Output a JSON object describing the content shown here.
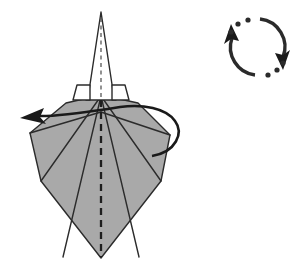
{
  "diagram": {
    "background_color": "#ffffff",
    "paper_fill_color": "#a9a9a9",
    "paper_back_color": "#ffffff",
    "line_color": "#2b2b2b",
    "figure": {
      "name": "folded-paper-model",
      "description": "Symmetrical kite-shaped folded paper model with a tall narrow white spike at the top and a wide gray body below",
      "body_outline_points": "101,95 170,135 161,180 101,258 41,180 30,133",
      "spike_outline_points": "101,12 88,97 115,97",
      "left_tab_points": "77,86 94,86 94,100 74,100",
      "right_tab_points": "108,86 125,86 128,100 108,100",
      "fold_lines": [
        "101,95 41,180",
        "101,95 62,258",
        "101,95 140,258",
        "101,95 161,180",
        "30,133 101,112",
        "170,135 101,112"
      ],
      "center_crease_label": "valley-fold-center-line",
      "center_crease_path": "101,20 101,258"
    },
    "arrows": [
      {
        "name": "wrap-around-arrow",
        "label": "fold-and-wrap-to-left-arrow",
        "direction": "left",
        "head_position": "22,118",
        "path": "166,146 C 182,138 180,118 162,110 C 140,101 118,110 96,114 C 72,118 50,118 32,117"
      }
    ],
    "symbols": [
      {
        "name": "rotate-turn-over-symbol",
        "label": "rotate / turn-over indicator",
        "center_x": 257,
        "center_y": 47,
        "radius": 28,
        "arc_count": 2,
        "dot_count": 8,
        "arrowhead_count": 2
      }
    ]
  }
}
